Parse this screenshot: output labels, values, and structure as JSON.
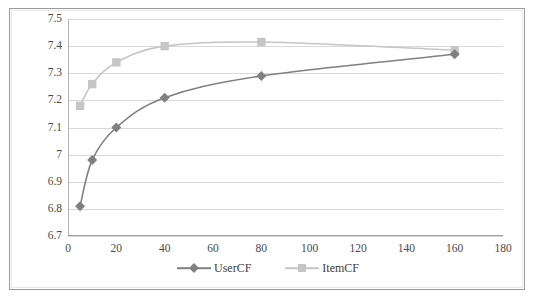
{
  "chart_data": {
    "type": "line",
    "title": "",
    "xlabel": "",
    "ylabel": "",
    "xlim": [
      0,
      180
    ],
    "ylim": [
      6.7,
      7.5
    ],
    "xticks": [
      0,
      20,
      40,
      60,
      80,
      100,
      120,
      140,
      160,
      180
    ],
    "yticks": [
      6.7,
      6.8,
      6.9,
      7,
      7.1,
      7.2,
      7.3,
      7.4,
      7.5
    ],
    "xtick_labels": [
      "0",
      "20",
      "40",
      "60",
      "80",
      "100",
      "120",
      "140",
      "160",
      "180"
    ],
    "ytick_labels": [
      "6.7",
      "6.8",
      "6.9",
      "7",
      "7.1",
      "7.2",
      "7.3",
      "7.4",
      "7.5"
    ],
    "grid": "horizontal",
    "legend_position": "bottom-center",
    "x": [
      5,
      10,
      20,
      40,
      80,
      160
    ],
    "series": [
      {
        "name": "UserCF",
        "color": "#808080",
        "marker": "diamond",
        "values": [
          6.81,
          6.98,
          7.1,
          7.21,
          7.29,
          7.37
        ]
      },
      {
        "name": "ItemCF",
        "color": "#c6c6c6",
        "marker": "square",
        "values": [
          7.18,
          7.26,
          7.34,
          7.4,
          7.415,
          7.385
        ]
      }
    ]
  },
  "legend": {
    "entries": [
      {
        "label": "UserCF"
      },
      {
        "label": "ItemCF"
      }
    ]
  },
  "colors": {
    "series_usercf": "#808080",
    "series_itemcf": "#c6c6c6",
    "gridline": "#d9d9d9",
    "axis": "#9e9e9e",
    "tick_text": "#4a4a4a",
    "frame_outer": "#9a9a9a"
  }
}
